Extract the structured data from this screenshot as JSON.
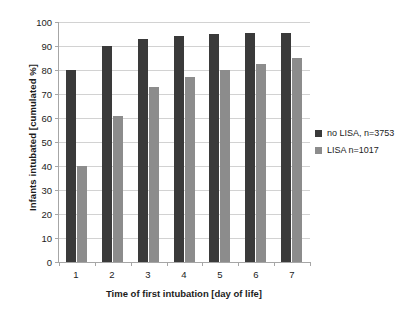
{
  "chart_data": {
    "type": "bar",
    "title": "",
    "xlabel": "Time of first intubation [day of life]",
    "ylabel": "Infants intubated [cumulated %]",
    "categories": [
      "1",
      "2",
      "3",
      "4",
      "5",
      "6",
      "7"
    ],
    "series": [
      {
        "name": "no LISA, n=3753",
        "color": "#3a3a3a",
        "values": [
          80,
          90,
          93,
          94,
          95,
          95.5,
          95.5
        ]
      },
      {
        "name": "LISA n=1017",
        "color": "#8c8c8c",
        "values": [
          40,
          61,
          73,
          77,
          80,
          82.5,
          85
        ]
      }
    ],
    "ylim": [
      0,
      100
    ],
    "ytick_labels": [
      "100",
      "90",
      "80",
      "70",
      "60",
      "50",
      "40",
      "30",
      "20",
      "10",
      "0"
    ],
    "ytick_values": [
      100,
      90,
      80,
      70,
      60,
      50,
      40,
      30,
      20,
      10,
      0
    ],
    "grid": true,
    "legend_position": "right"
  }
}
